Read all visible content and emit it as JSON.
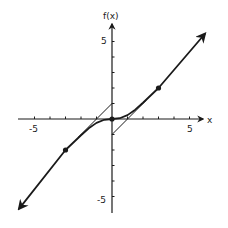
{
  "chart_data": {
    "type": "line",
    "title": "",
    "xlabel": "x",
    "ylabel": "f(x)",
    "xlim": [
      -6,
      6
    ],
    "ylim": [
      -6,
      6
    ],
    "grid": false,
    "x_tick_labels": [
      {
        "value": -5,
        "label": "-5"
      },
      {
        "value": 5,
        "label": "5"
      }
    ],
    "y_tick_labels": [
      {
        "value": 5,
        "label": "5"
      },
      {
        "value": -5,
        "label": "-5"
      }
    ],
    "x_ticks": [
      -5,
      -4,
      -3,
      -2,
      -1,
      1,
      2,
      3,
      4,
      5
    ],
    "y_ticks": [
      -5,
      -4,
      -3,
      -2,
      -1,
      1,
      2,
      3,
      4,
      5
    ],
    "series": [
      {
        "name": "f(x)",
        "style": "thick",
        "points": [
          [
            -6,
            -5.8
          ],
          [
            -3,
            -2
          ],
          [
            -2,
            -1.05
          ],
          [
            -1.5,
            -0.6
          ],
          [
            -1,
            -0.25
          ],
          [
            -0.5,
            -0.05
          ],
          [
            0,
            0
          ],
          [
            0.5,
            0.05
          ],
          [
            1,
            0.25
          ],
          [
            1.5,
            0.6
          ],
          [
            2,
            1.05
          ],
          [
            3,
            2
          ],
          [
            6,
            5.5
          ]
        ],
        "arrows": true
      },
      {
        "name": "asymptote y = x + 1 (x < 0)",
        "style": "thin",
        "points": [
          [
            -2.2,
            -1.2
          ],
          [
            0,
            1
          ]
        ]
      },
      {
        "name": "asymptote y = x - 1 (x > 0)",
        "style": "thin",
        "points": [
          [
            0,
            -1
          ],
          [
            2.2,
            1.2
          ]
        ]
      }
    ],
    "marked_points": [
      [
        -3,
        -2
      ],
      [
        0,
        0
      ],
      [
        3,
        2
      ]
    ]
  },
  "labels": {
    "x_axis": "x",
    "y_axis": "f(x)",
    "x_neg5": "-5",
    "x_pos5": "5",
    "y_pos5": "5",
    "y_neg5": "-5"
  }
}
